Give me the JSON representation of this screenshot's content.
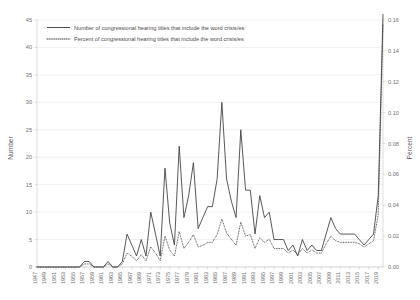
{
  "chart_data": {
    "type": "line",
    "title": "",
    "subtitle": "",
    "xlabel": "",
    "ylabel": "Number",
    "y2label": "Percent",
    "grid": true,
    "legend_position": "top-left",
    "ylim": [
      0,
      45
    ],
    "y2lim": [
      0.0,
      0.16
    ],
    "xlim": [
      1947,
      2020
    ],
    "yticks": [
      "0",
      "5",
      "10",
      "15",
      "20",
      "25",
      "30",
      "35",
      "40",
      "45"
    ],
    "ytick_values": [
      0,
      5,
      10,
      15,
      20,
      25,
      30,
      35,
      40,
      45
    ],
    "y2ticks": [
      "0.00",
      "0.02",
      "0.04",
      "0.06",
      "0.08",
      "0.10",
      "0.12",
      "0.14",
      "0.16"
    ],
    "y2tick_values": [
      0.0,
      0.02,
      0.04,
      0.06,
      0.08,
      0.1,
      0.12,
      0.14,
      0.16
    ],
    "xticks": [
      "1947",
      "1949",
      "1951",
      "1953",
      "1955",
      "1957",
      "1959",
      "1961",
      "1963",
      "1965",
      "1967",
      "1969",
      "1971",
      "1973",
      "1975",
      "1977",
      "1979",
      "1981",
      "1983",
      "1985",
      "1987",
      "1989",
      "1991",
      "1993",
      "1995",
      "1997",
      "1999",
      "2001",
      "2003",
      "2005",
      "2007",
      "2009",
      "2011",
      "2013",
      "2015",
      "2017",
      "2019"
    ],
    "x": [
      1947,
      1948,
      1949,
      1950,
      1951,
      1952,
      1953,
      1954,
      1955,
      1956,
      1957,
      1958,
      1959,
      1960,
      1961,
      1962,
      1963,
      1964,
      1965,
      1966,
      1967,
      1968,
      1969,
      1970,
      1971,
      1972,
      1973,
      1974,
      1975,
      1976,
      1977,
      1978,
      1979,
      1980,
      1981,
      1982,
      1983,
      1984,
      1985,
      1986,
      1987,
      1988,
      1989,
      1990,
      1991,
      1992,
      1993,
      1994,
      1995,
      1996,
      1997,
      1998,
      1999,
      2000,
      2001,
      2002,
      2003,
      2004,
      2005,
      2006,
      2007,
      2008,
      2009,
      2010,
      2011,
      2012,
      2013,
      2014,
      2015,
      2016,
      2017,
      2018,
      2019,
      2020
    ],
    "series": [
      {
        "name": "Number of congressional hearing titles that include the word crisis/es",
        "style": "solid",
        "axis": "left",
        "values": [
          0,
          0,
          0,
          0,
          0,
          0,
          0,
          0,
          0,
          0,
          1,
          1,
          0,
          0,
          0,
          1,
          0,
          0,
          1,
          6,
          4,
          2,
          5,
          2,
          10,
          6,
          2,
          18,
          8,
          4,
          22,
          9,
          13,
          19,
          7,
          9,
          11,
          11,
          16,
          30,
          16,
          12,
          9,
          25,
          14,
          14,
          6,
          13,
          9,
          10,
          5,
          5,
          5,
          3,
          4,
          2,
          5,
          3,
          4,
          3,
          3,
          6,
          9,
          7,
          6,
          6,
          6,
          6,
          5,
          4,
          5,
          6,
          13,
          46
        ]
      },
      {
        "name": "Percent of congressional hearing titles that include the word crisis/es",
        "style": "dotted",
        "axis": "right",
        "values": [
          0.0,
          0.0,
          0.0,
          0.0,
          0.0,
          0.0,
          0.0,
          0.0,
          0.0,
          0.0,
          0.002,
          0.002,
          0.0,
          0.0,
          0.0,
          0.002,
          0.0,
          0.0,
          0.002,
          0.009,
          0.007,
          0.004,
          0.008,
          0.004,
          0.013,
          0.009,
          0.004,
          0.02,
          0.011,
          0.007,
          0.023,
          0.012,
          0.016,
          0.021,
          0.013,
          0.014,
          0.016,
          0.016,
          0.021,
          0.031,
          0.022,
          0.018,
          0.014,
          0.029,
          0.02,
          0.021,
          0.012,
          0.019,
          0.016,
          0.018,
          0.012,
          0.012,
          0.012,
          0.009,
          0.011,
          0.008,
          0.012,
          0.009,
          0.011,
          0.009,
          0.009,
          0.015,
          0.02,
          0.017,
          0.016,
          0.016,
          0.016,
          0.016,
          0.015,
          0.013,
          0.015,
          0.017,
          0.034,
          0.157
        ]
      }
    ]
  },
  "legend": {
    "items": [
      {
        "label": "Number of congressional hearing titles that include the word crisis/es",
        "marker": "solid-line"
      },
      {
        "label": "Percent of congressional hearing titles that include the word crisis/es",
        "marker": "dotted-line"
      }
    ]
  },
  "axes": {
    "left_title": "Number",
    "right_title": "Percent"
  }
}
